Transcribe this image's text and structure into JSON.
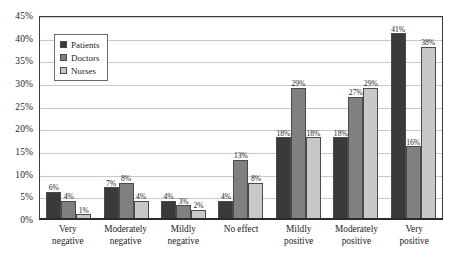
{
  "chart_data": {
    "type": "bar",
    "title": "",
    "subtitle": "",
    "xlabel": "",
    "ylabel": "",
    "ylim": [
      0,
      45
    ],
    "ytick_step": 5,
    "grid": true,
    "legend_position": "upper-left-inside",
    "value_suffix": "%",
    "categories": [
      "Very negative",
      "Moderately negative",
      "Mildly negative",
      "No effect",
      "Mildly positive",
      "Moderately positive",
      "Very positive"
    ],
    "category_lines": [
      [
        "Very",
        "negative"
      ],
      [
        "Moderately",
        "negative"
      ],
      [
        "Mildly",
        "negative"
      ],
      [
        "No effect",
        ""
      ],
      [
        "Mildly",
        "positive"
      ],
      [
        "Moderately",
        "positive"
      ],
      [
        "Very",
        "positive"
      ]
    ],
    "ytick_labels": [
      "45%",
      "40%",
      "35%",
      "30%",
      "25%",
      "20%",
      "15%",
      "10%",
      "5%",
      "0%"
    ],
    "ytick_values": [
      45,
      40,
      35,
      30,
      25,
      20,
      15,
      10,
      5,
      0
    ],
    "series": [
      {
        "name": "Patients",
        "color": "#3a3a3a",
        "values": [
          6,
          7,
          4,
          4,
          18,
          18,
          41
        ],
        "labels": [
          "6%",
          "7%",
          "4%",
          "4%",
          "18%",
          "18%",
          "41%"
        ]
      },
      {
        "name": "Doctors",
        "color": "#808080",
        "values": [
          4,
          8,
          3,
          13,
          29,
          27,
          16
        ],
        "labels": [
          "4%",
          "8%",
          "3%",
          "13%",
          "29%",
          "27%",
          "16%"
        ]
      },
      {
        "name": "Nurses",
        "color": "#c8c8c8",
        "values": [
          1,
          4,
          2,
          8,
          18,
          29,
          38
        ],
        "labels": [
          "1%",
          "4%",
          "2%",
          "8%",
          "18%",
          "29%",
          "38%"
        ]
      }
    ]
  },
  "legend": {
    "items": [
      {
        "label": "Patients",
        "color": "#3a3a3a"
      },
      {
        "label": "Doctors",
        "color": "#808080"
      },
      {
        "label": "Nurses",
        "color": "#c8c8c8"
      }
    ]
  }
}
